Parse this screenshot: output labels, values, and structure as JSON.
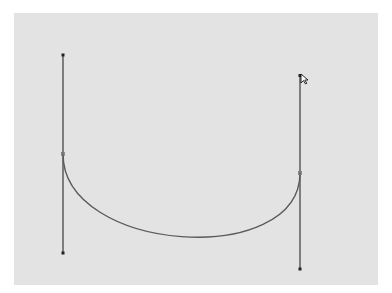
{
  "canvas": {
    "background": "#e3e3e3",
    "page_background": "#ffffff"
  },
  "bezier": {
    "stroke_color": "#555555",
    "handle_color": "#333333",
    "segment": {
      "start_anchor": {
        "x": 63,
        "y": 154
      },
      "end_anchor": {
        "x": 300,
        "y": 173
      },
      "control_1": {
        "x": 63,
        "y": 253
      },
      "control_2": {
        "x": 300,
        "y": 269
      },
      "lowest_point_approx": {
        "x": 205,
        "y": 238
      }
    },
    "handles": [
      {
        "name": "left-handle",
        "top": {
          "x": 63,
          "y": 55
        },
        "bottom": {
          "x": 63,
          "y": 253
        },
        "anchor": {
          "x": 63,
          "y": 154
        }
      },
      {
        "name": "right-handle",
        "top": {
          "x": 300,
          "y": 75
        },
        "bottom": {
          "x": 300,
          "y": 269
        },
        "anchor": {
          "x": 300,
          "y": 173
        }
      }
    ]
  },
  "cursor": {
    "icon": "arrow-pointer-icon",
    "x": 302,
    "y": 75
  }
}
